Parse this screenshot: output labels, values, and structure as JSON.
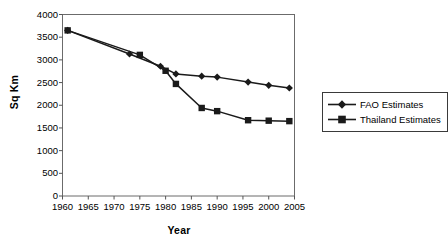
{
  "chart_data": {
    "type": "line",
    "title": "",
    "xlabel": "Year",
    "ylabel": "Sq Km",
    "xlim": [
      1960,
      2005
    ],
    "ylim": [
      0,
      4000
    ],
    "xticks": [
      1960,
      1965,
      1970,
      1975,
      1980,
      1985,
      1990,
      1995,
      2000,
      2005
    ],
    "yticks": [
      0,
      500,
      1000,
      1500,
      2000,
      2500,
      3000,
      3500,
      4000
    ],
    "grid": false,
    "legend_position": "right",
    "series": [
      {
        "name": "FAO Estimates",
        "marker": "diamond",
        "color": "#1a1a1a",
        "x": [
          1961,
          1973,
          1979,
          1982,
          1987,
          1990,
          1996,
          2000,
          2004
        ],
        "values": [
          3650,
          3130,
          2860,
          2690,
          2640,
          2620,
          2510,
          2440,
          2380
        ]
      },
      {
        "name": "Thailand Estimates",
        "marker": "square",
        "color": "#1a1a1a",
        "x": [
          1961,
          1975,
          1980,
          1982,
          1987,
          1990,
          1996,
          2000,
          2004
        ],
        "values": [
          3650,
          3110,
          2760,
          2470,
          1940,
          1870,
          1670,
          1660,
          1650
        ]
      }
    ]
  },
  "axes": {
    "ylabel": "Sq Km",
    "xlabel": "Year",
    "ytick_labels": [
      "0",
      "500",
      "1000",
      "1500",
      "2000",
      "2500",
      "3000",
      "3500",
      "4000"
    ],
    "xtick_labels": [
      "1960",
      "1965",
      "1970",
      "1975",
      "1980",
      "1985",
      "1990",
      "1995",
      "2000",
      "2005"
    ]
  },
  "legend": {
    "items": [
      {
        "label": "FAO Estimates",
        "marker": "diamond-marker-icon"
      },
      {
        "label": "Thailand Estimates",
        "marker": "square-marker-icon"
      }
    ]
  },
  "style": {
    "line_color": "#1a1a1a",
    "axis_color": "#555555",
    "background": "#ffffff"
  }
}
